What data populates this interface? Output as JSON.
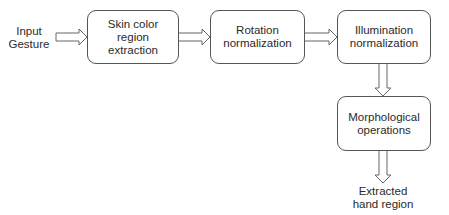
{
  "diagram": {
    "input_label": "Input\nGesture",
    "output_label": "Extracted\nhand region",
    "nodes": [
      {
        "id": "skin",
        "label": "Skin color\nregion\nextraction"
      },
      {
        "id": "rotation",
        "label": "Rotation\nnormalization"
      },
      {
        "id": "illumination",
        "label": "Illumination\nnormalization"
      },
      {
        "id": "morph",
        "label": "Morphological\noperations"
      }
    ],
    "edges": [
      {
        "from": "Input Gesture",
        "to": "skin"
      },
      {
        "from": "skin",
        "to": "rotation"
      },
      {
        "from": "rotation",
        "to": "illumination"
      },
      {
        "from": "illumination",
        "to": "morph"
      },
      {
        "from": "morph",
        "to": "Extracted hand region"
      }
    ],
    "colors": {
      "stroke": "#555555",
      "text": "#2a2a2a",
      "background": "#ffffff"
    }
  }
}
